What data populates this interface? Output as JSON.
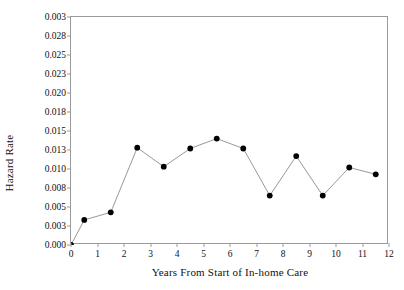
{
  "chart_data": {
    "type": "line",
    "title": "",
    "xlabel": "Years From Start of In-home Care",
    "ylabel": "Hazard Rate",
    "xlim": [
      0,
      12
    ],
    "ylim": [
      0.0,
      0.03
    ],
    "grid": false,
    "legend": "none",
    "marker": "filled-circle",
    "line_color": "#808080",
    "marker_color": "#000000",
    "x": [
      0.0,
      0.5,
      1.5,
      2.5,
      3.5,
      4.5,
      5.5,
      6.5,
      7.5,
      8.5,
      9.5,
      10.5,
      11.5
    ],
    "values": [
      0.0,
      0.0033,
      0.0043,
      0.0128,
      0.0103,
      0.0127,
      0.014,
      0.0127,
      0.0065,
      0.0117,
      0.0065,
      0.0102,
      0.0093
    ],
    "xticks": [
      0,
      1,
      2,
      3,
      4,
      5,
      6,
      7,
      8,
      9,
      10,
      11,
      12
    ],
    "xtick_labels": [
      "0",
      "1",
      "2",
      "3",
      "4",
      "5",
      "6",
      "7",
      "8",
      "9",
      "10",
      "11",
      "12"
    ],
    "yticks": [
      0.0,
      0.0025,
      0.005,
      0.0075,
      0.01,
      0.0125,
      0.015,
      0.0175,
      0.02,
      0.0225,
      0.025,
      0.0275,
      0.03
    ],
    "ytick_labels": [
      "0.000",
      "0.003",
      "0.005",
      "0.008",
      "0.010",
      "0.013",
      "0.015",
      "0.018",
      "0.020",
      "0.023",
      "0.025",
      "0.028",
      "0.003"
    ]
  }
}
